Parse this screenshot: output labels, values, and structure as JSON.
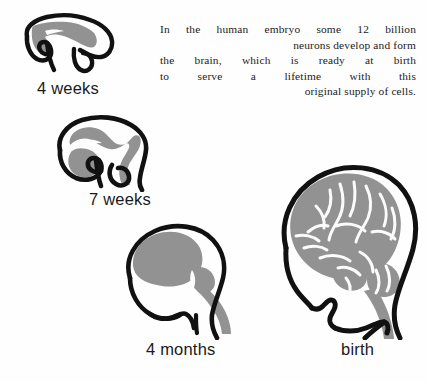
{
  "figure": {
    "background_color": "#fefefe",
    "outline_color": "#111111",
    "tissue_color": "#929292",
    "sulci_color": "#fbfbfb"
  },
  "caption": {
    "full_text": "In the human embryo some 12 billion neurons develop and form the brain, which is ready at birth to serve a lifetime with this original supply of cells.",
    "lines": [
      "In the human embryo some 12 billion",
      "neurons develop and form",
      "the brain, which is ready at birth",
      "to serve a lifetime with this",
      "original supply of cells."
    ],
    "alignment": "right"
  },
  "stages": [
    {
      "id": "4-weeks",
      "label": "4 weeks",
      "order": 1,
      "description": "Embryonic neural tube with primitive brain vesicles"
    },
    {
      "id": "7-weeks",
      "label": "7 weeks",
      "order": 2,
      "description": "Embryo head in profile with enlarging forebrain"
    },
    {
      "id": "4-months",
      "label": "4 months",
      "order": 3,
      "description": "Fetal head in profile with smooth cerebral hemisphere and brainstem"
    },
    {
      "id": "birth",
      "label": "birth",
      "order": 4,
      "description": "Newborn head in profile with fully convoluted brain, cerebellum and brainstem"
    }
  ]
}
